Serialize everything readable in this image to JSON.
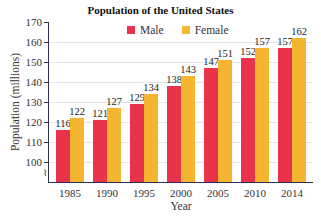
{
  "chart_data": {
    "type": "bar",
    "title": "Population of the United States",
    "xlabel": "Year",
    "ylabel": "Population (millions)",
    "categories": [
      "1985",
      "1990",
      "1995",
      "2000",
      "2005",
      "2010",
      "2014"
    ],
    "series": [
      {
        "name": "Male",
        "color": "#e8334a",
        "values": [
          116,
          121,
          129,
          138,
          147,
          152,
          157
        ]
      },
      {
        "name": "Female",
        "color": "#f6b530",
        "values": [
          122,
          127,
          134,
          143,
          151,
          157,
          162
        ]
      }
    ],
    "ylim": [
      92,
      170
    ],
    "yticks": [
      100,
      110,
      120,
      130,
      140,
      150,
      160,
      170
    ],
    "axis_break": true,
    "grid": true,
    "legend_position": "top-center",
    "data_labels": true
  }
}
